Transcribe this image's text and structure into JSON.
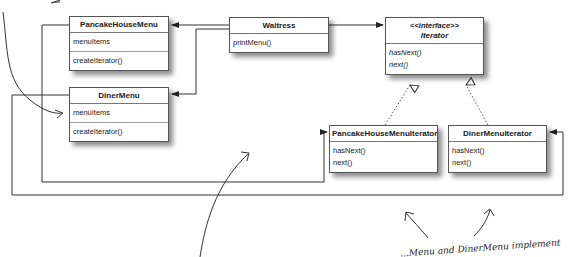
{
  "diagram": {
    "classes": {
      "pancake_house_menu": {
        "name": "PancakeHouseMenu",
        "attributes": [
          "menuItems"
        ],
        "methods": [
          "createIterator()"
        ]
      },
      "waitress": {
        "name": "Waitress",
        "methods": [
          "printMenu()"
        ]
      },
      "iterator": {
        "stereotype": "<<interface>>",
        "name": "Iterator",
        "methods": [
          "hasNext()",
          "next()"
        ]
      },
      "diner_menu": {
        "name": "DinerMenu",
        "attributes": [
          "menuItems"
        ],
        "methods": [
          "createIterator()"
        ]
      },
      "pancake_house_menu_iterator": {
        "name": "PancakeHouseMenuIterator",
        "methods": [
          "hasNext()",
          "next()"
        ]
      },
      "diner_menu_iterator": {
        "name": "DinerMenuIterator",
        "methods": [
          "hasNext()",
          "next()"
        ]
      }
    },
    "annotations": {
      "bottom_right": "...Menu and DinerMenu implement"
    },
    "colors": {
      "line": "#333333",
      "box_border": "#555555",
      "background": "#ffffff"
    }
  }
}
